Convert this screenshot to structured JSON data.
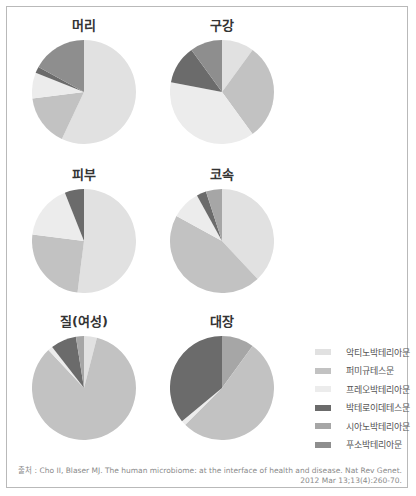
{
  "chart_data": {
    "type": "pie",
    "legend": [
      {
        "label": "악티노박테리아문",
        "color": "#e1e1e1"
      },
      {
        "label": "퍼미규테스문",
        "color": "#c2c2c2"
      },
      {
        "label": "프레오박테리아문",
        "color": "#ececec"
      },
      {
        "label": "박테로이데테스문",
        "color": "#6b6b6b"
      },
      {
        "label": "시아노박테리아문",
        "color": "#a6a6a6"
      },
      {
        "label": "푸소박테리아문",
        "color": "#8e8e8e"
      }
    ],
    "charts": [
      {
        "title": "머리",
        "slices": [
          {
            "label": "악티노박테리아문",
            "value": 57
          },
          {
            "label": "퍼미규테스문",
            "value": 16
          },
          {
            "label": "프레오박테리아문",
            "value": 8
          },
          {
            "label": "박테로이데테스문",
            "value": 2
          },
          {
            "label": "푸소박테리아문",
            "value": 17
          }
        ]
      },
      {
        "title": "구강",
        "slices": [
          {
            "label": "악티노박테리아문",
            "value": 10
          },
          {
            "label": "퍼미규테스문",
            "value": 30
          },
          {
            "label": "프레오박테리아문",
            "value": 38
          },
          {
            "label": "박테로이데테스문",
            "value": 12
          },
          {
            "label": "푸소박테리아문",
            "value": 10
          }
        ]
      },
      {
        "title": "피부",
        "slices": [
          {
            "label": "악티노박테리아문",
            "value": 52
          },
          {
            "label": "퍼미규테스문",
            "value": 25
          },
          {
            "label": "프레오박테리아문",
            "value": 17
          },
          {
            "label": "박테로이데테스문",
            "value": 6
          }
        ]
      },
      {
        "title": "코속",
        "slices": [
          {
            "label": "악티노박테리아문",
            "value": 38
          },
          {
            "label": "퍼미규테스문",
            "value": 45
          },
          {
            "label": "프레오박테리아문",
            "value": 9
          },
          {
            "label": "박테로이데테스문",
            "value": 3
          },
          {
            "label": "시아노박테리아문",
            "value": 5
          }
        ]
      },
      {
        "title": "질(여성)",
        "slices": [
          {
            "label": "악티노박테리아문",
            "value": 4
          },
          {
            "label": "퍼미규테스문",
            "value": 84
          },
          {
            "label": "프레오박테리아문",
            "value": 1.5
          },
          {
            "label": "박테로이데테스문",
            "value": 8
          },
          {
            "label": "시아노박테리아문",
            "value": 2.5
          }
        ]
      },
      {
        "title": "대장",
        "slices": [
          {
            "label": "시아노박테리아문",
            "value": 10
          },
          {
            "label": "퍼미규테스문",
            "value": 52.5
          },
          {
            "label": "프레오박테리아문",
            "value": 1.5
          },
          {
            "label": "박테로이데테스문",
            "value": 36
          }
        ]
      }
    ]
  },
  "source": {
    "line1": "출처 : Cho II, Blaser MJ. The human microbiome: at the interface of health and disease. Nat Rev Genet.",
    "line2": "2012 Mar 13;13(4):260-70."
  }
}
